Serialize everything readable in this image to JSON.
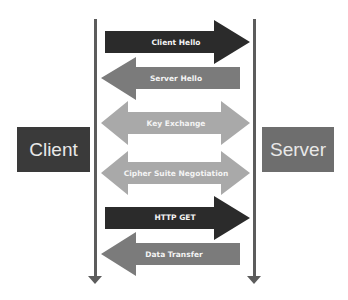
{
  "diagram": {
    "endpoints": {
      "client": {
        "label": "Client",
        "color": "#3a3a3a"
      },
      "server": {
        "label": "Server",
        "color": "#6e6e6e"
      }
    },
    "messages": [
      {
        "label": "Client Hello",
        "direction": "client-to-server",
        "color": "#2b2b2b"
      },
      {
        "label": "Server Hello",
        "direction": "server-to-client",
        "color": "#7b7b7b"
      },
      {
        "label": "Key Exchange",
        "direction": "bidirectional",
        "color": "#a9a9a9"
      },
      {
        "label": "Cipher Suite Negotiation",
        "direction": "bidirectional",
        "color": "#a9a9a9"
      },
      {
        "label": "HTTP GET",
        "direction": "client-to-server",
        "color": "#2b2b2b"
      },
      {
        "label": "Data Transfer",
        "direction": "server-to-client",
        "color": "#7b7b7b"
      }
    ],
    "lifeline_color": "#5c5c5c"
  }
}
